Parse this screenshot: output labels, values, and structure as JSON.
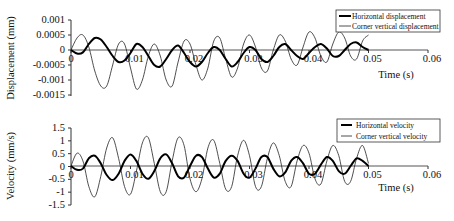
{
  "chart_data": [
    {
      "type": "line",
      "title": "",
      "xlabel": "Time (s)",
      "ylabel": "Displacement (mm)",
      "xlim": [
        0,
        0.06
      ],
      "ylim": [
        -0.0015,
        0.001
      ],
      "xticks": [
        "0",
        "0.01",
        "0.02",
        "0.03",
        "0.04",
        "0.05",
        "0.06"
      ],
      "yticks": [
        "0.001",
        "0.0005",
        "0",
        "-0.0005",
        "-0.001",
        "-0.0015"
      ],
      "grid": false,
      "legend_position": "upper right",
      "x": [
        0,
        0.001,
        0.002,
        0.003,
        0.004,
        0.005,
        0.006,
        0.007,
        0.008,
        0.009,
        0.01,
        0.011,
        0.012,
        0.013,
        0.014,
        0.015,
        0.016,
        0.017,
        0.018,
        0.019,
        0.02,
        0.021,
        0.022,
        0.023,
        0.024,
        0.025,
        0.026,
        0.027,
        0.028,
        0.029,
        0.03,
        0.031,
        0.032,
        0.033,
        0.034,
        0.035,
        0.036,
        0.037,
        0.038,
        0.039,
        0.04,
        0.041,
        0.042,
        0.043,
        0.044,
        0.045,
        0.046,
        0.047,
        0.048,
        0.049,
        0.05
      ],
      "series": [
        {
          "name": "Horizontal displacement",
          "style": "thick",
          "values": [
            0,
            -0.00012,
            -8e-05,
            0.0002,
            0.0004,
            0.00035,
            0.0001,
            -0.0002,
            -0.0004,
            -0.00035,
            -0.0001,
            0.0002,
            0.0001,
            -0.0002,
            -0.0005,
            -0.00055,
            -0.0003,
            0,
            0.00015,
            -0.0001,
            -0.0004,
            -0.00055,
            -0.0004,
            -0.0001,
            0.0001,
            0,
            -0.0003,
            -0.00055,
            -0.0004,
            -0.0001,
            0.0001,
            0,
            -0.0003,
            -0.0004,
            -0.0002,
            0.0001,
            0.0002,
            0,
            -0.0002,
            -0.0003,
            -0.0001,
            0.0001,
            0.0002,
            5e-05,
            -0.0002,
            -0.0002,
            0,
            0.0002,
            0.00025,
            0.0001,
            0
          ]
        },
        {
          "name": "Corner vertical displacement",
          "style": "thin",
          "values": [
            0,
            0.0004,
            0.0005,
            0.0001,
            -0.0007,
            -0.0012,
            -0.0012,
            -0.0005,
            0.0002,
            0.0002,
            -0.0006,
            -0.0013,
            -0.001,
            -0.0002,
            0.0002,
            -0.0002,
            -0.001,
            -0.0012,
            -0.0004,
            0.0003,
            0.0002,
            -0.0005,
            -0.001,
            -0.0006,
            0.0003,
            0.0004,
            -0.0003,
            -0.0009,
            -0.0006,
            0.0002,
            0.0005,
            0.0001,
            -0.0006,
            -0.0007,
            0,
            0.0005,
            0.0003,
            -0.0003,
            -0.0005,
            0.0001,
            0.0006,
            0.0004,
            -0.0002,
            -0.0004,
            0.0002,
            0.0006,
            0.0004,
            -0.0002,
            -0.0003,
            0.0003,
            0.0005
          ]
        }
      ]
    },
    {
      "type": "line",
      "title": "",
      "xlabel": "Time (s)",
      "ylabel": "Velocity (mm/s)",
      "xlim": [
        0,
        0.06
      ],
      "ylim": [
        -1.5,
        1.5
      ],
      "xticks": [
        "0",
        "0.01",
        "0.02",
        "0.03",
        "0.04",
        "0.05",
        "0.06"
      ],
      "yticks": [
        "1.5",
        "1",
        "0.5",
        "0",
        "-0.5",
        "-1",
        "-1.5"
      ],
      "grid": false,
      "legend_position": "upper right",
      "x": [
        0,
        0.001,
        0.002,
        0.003,
        0.004,
        0.005,
        0.006,
        0.007,
        0.008,
        0.009,
        0.01,
        0.011,
        0.012,
        0.013,
        0.014,
        0.015,
        0.016,
        0.017,
        0.018,
        0.019,
        0.02,
        0.021,
        0.022,
        0.023,
        0.024,
        0.025,
        0.026,
        0.027,
        0.028,
        0.029,
        0.03,
        0.031,
        0.032,
        0.033,
        0.034,
        0.035,
        0.036,
        0.037,
        0.038,
        0.039,
        0.04,
        0.041,
        0.042,
        0.043,
        0.044,
        0.045,
        0.046,
        0.047,
        0.048,
        0.049,
        0.05
      ],
      "series": [
        {
          "name": "Horizontal velocity",
          "style": "thick",
          "values": [
            0,
            -0.15,
            -0.1,
            0.3,
            0.4,
            0.1,
            -0.35,
            -0.55,
            -0.3,
            0.2,
            0.45,
            0.2,
            -0.3,
            -0.5,
            -0.2,
            0.3,
            0.45,
            0.1,
            -0.4,
            -0.45,
            0,
            0.4,
            0.35,
            -0.1,
            -0.45,
            -0.3,
            0.2,
            0.4,
            0.2,
            -0.3,
            -0.45,
            -0.1,
            0.35,
            0.35,
            -0.1,
            -0.4,
            -0.25,
            0.2,
            0.35,
            0.1,
            -0.3,
            -0.3,
            0.05,
            0.35,
            0.2,
            -0.2,
            -0.3,
            0,
            0.3,
            0.2,
            0
          ]
        },
        {
          "name": "Corner vertical velocity",
          "style": "thin",
          "values": [
            0,
            0.5,
            0.2,
            -0.8,
            -1.2,
            -0.4,
            0.7,
            1.1,
            0.3,
            -0.8,
            -1.1,
            -0.2,
            0.9,
            1.1,
            0.1,
            -1.0,
            -1.0,
            0.2,
            1.1,
            0.8,
            -0.5,
            -1.0,
            -0.5,
            0.7,
            1.0,
            0.1,
            -0.9,
            -0.8,
            0.4,
            1.0,
            0.4,
            -0.8,
            -0.8,
            0.3,
            0.9,
            0.4,
            -0.6,
            -0.8,
            0.2,
            0.8,
            0.5,
            -0.5,
            -0.7,
            0.2,
            0.8,
            0.4,
            -0.6,
            -0.6,
            0.3,
            0.8,
            0.1
          ]
        }
      ]
    }
  ],
  "panels": [
    {
      "ylabel": "Displacement (mm)",
      "xlabel": "Time (s)",
      "yticks": [
        "0.001",
        "0.0005",
        "0",
        "-0.0005",
        "-0.001",
        "-0.0015"
      ],
      "xticks": [
        "0",
        "0.01",
        "0.02",
        "0.03",
        "0.04",
        "0.05",
        "0.06"
      ],
      "legend": [
        "Horizontal displacement",
        "Corner vertical displacement"
      ]
    },
    {
      "ylabel": "Velocity (mm/s)",
      "xlabel": "Time (s)",
      "yticks": [
        "1.5",
        "1",
        "0.5",
        "0",
        "-0.5",
        "-1",
        "-1.5"
      ],
      "xticks": [
        "0",
        "0.01",
        "0.02",
        "0.03",
        "0.04",
        "0.05",
        "0.06"
      ],
      "legend": [
        "Horizontal velocity",
        "Corner vertical velocity"
      ]
    }
  ]
}
